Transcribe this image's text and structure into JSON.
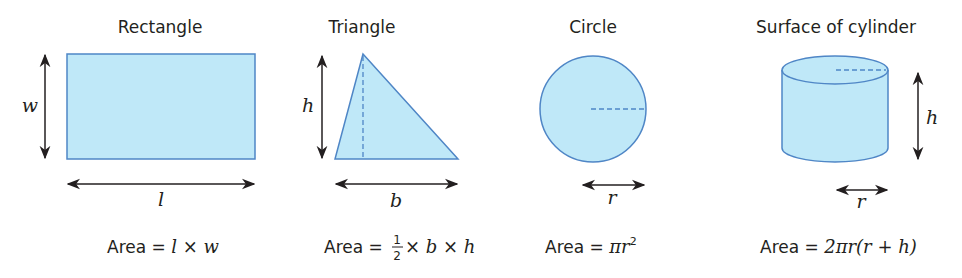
{
  "colors": {
    "fill": "#bfe8f8",
    "stroke": "#4f86c6",
    "text": "#231f20"
  },
  "shapes": [
    {
      "title": "Rectangle",
      "dims": [
        "w",
        "l"
      ],
      "formula": {
        "prefix": "Area = ",
        "expr": "l × w"
      }
    },
    {
      "title": "Triangle",
      "dims": [
        "h",
        "b"
      ],
      "formula": {
        "prefix": "Area = ",
        "frac_num": "1",
        "frac_den": "2",
        "expr": "× b × h"
      }
    },
    {
      "title": "Circle",
      "dims": [
        "r"
      ],
      "formula": {
        "prefix": "Area = ",
        "expr": "πr",
        "sup": "2"
      }
    },
    {
      "title": "Surface of cylinder",
      "dims": [
        "h",
        "r"
      ],
      "formula": {
        "prefix": "Area = ",
        "expr": "2πr(r + h)"
      }
    }
  ]
}
